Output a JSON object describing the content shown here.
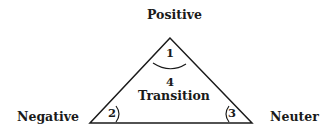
{
  "diagram": {
    "vertices": {
      "top": "Positive",
      "left": "Negative",
      "right": "Neuter"
    },
    "angles": {
      "top": "1",
      "left": "2",
      "right": "3"
    },
    "center": {
      "number": "4",
      "label": "Transition"
    },
    "colors": {
      "stroke": "#1a1a1a",
      "background": "#ffffff"
    }
  }
}
